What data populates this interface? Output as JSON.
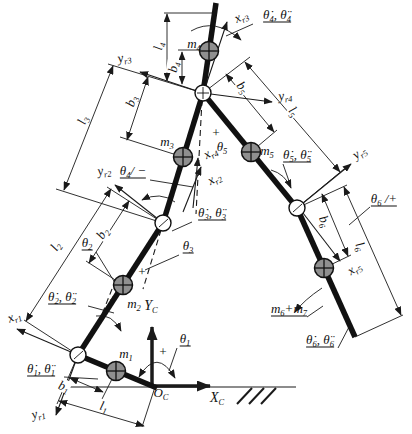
{
  "colors": {
    "line": "#1a1a1a",
    "mass_fill": "#8f8f8f",
    "background": "#ffffff"
  },
  "labels": [
    {
      "name": "x-r3",
      "x": 241,
      "y": 16,
      "rot": -25,
      "parts": [
        {
          "t": "x"
        },
        {
          "s": "r3"
        }
      ]
    },
    {
      "name": "theta4-rates",
      "x": 277,
      "y": 15,
      "underline": true,
      "parts": [
        {
          "t": "θ̇"
        },
        {
          "s": "4"
        },
        {
          "t": ", θ̈"
        },
        {
          "s": "4"
        }
      ]
    },
    {
      "name": "m4",
      "x": 194,
      "y": 43,
      "parts": [
        {
          "t": "m"
        },
        {
          "s": "4"
        }
      ]
    },
    {
      "name": "l4",
      "x": 158,
      "y": 46,
      "rot": -80,
      "bg": true,
      "parts": [
        {
          "t": "l"
        },
        {
          "s": "4"
        }
      ]
    },
    {
      "name": "b4",
      "x": 173,
      "y": 67,
      "rot": -80,
      "bg": true,
      "parts": [
        {
          "t": "b"
        },
        {
          "s": "4"
        }
      ]
    },
    {
      "name": "y-r3",
      "x": 124,
      "y": 57,
      "rot": -12,
      "parts": [
        {
          "t": "y"
        },
        {
          "s": "r3"
        }
      ]
    },
    {
      "name": "b3",
      "x": 131,
      "y": 101,
      "rot": -72,
      "bg": true,
      "parts": [
        {
          "t": "b"
        },
        {
          "s": "3"
        }
      ]
    },
    {
      "name": "l3",
      "x": 82,
      "y": 120,
      "rot": -70,
      "bg": true,
      "parts": [
        {
          "t": "l"
        },
        {
          "s": "3"
        }
      ]
    },
    {
      "name": "y-r4",
      "x": 285,
      "y": 95,
      "rot": -8,
      "parts": [
        {
          "t": "y"
        },
        {
          "s": "r4"
        }
      ]
    },
    {
      "name": "b5",
      "x": 243,
      "y": 87,
      "rot": 51,
      "bg": true,
      "parts": [
        {
          "t": "b"
        },
        {
          "s": "5"
        }
      ]
    },
    {
      "name": "l5",
      "x": 294,
      "y": 111,
      "rot": 50,
      "bg": true,
      "parts": [
        {
          "t": "l"
        },
        {
          "s": "5"
        }
      ]
    },
    {
      "name": "plus-theta5",
      "x": 216,
      "y": 132,
      "parts": [
        {
          "t": "+"
        }
      ]
    },
    {
      "name": "theta5",
      "x": 222,
      "y": 146,
      "parts": [
        {
          "t": "θ"
        },
        {
          "s": "5"
        }
      ]
    },
    {
      "name": "m5",
      "x": 267,
      "y": 150,
      "parts": [
        {
          "t": "m"
        },
        {
          "s": "5"
        }
      ]
    },
    {
      "name": "theta5-rates",
      "x": 297,
      "y": 155,
      "underline": true,
      "parts": [
        {
          "t": "θ̇"
        },
        {
          "s": "5"
        },
        {
          "t": ", θ̈"
        },
        {
          "s": "5"
        }
      ]
    },
    {
      "name": "y-r5",
      "x": 359,
      "y": 152,
      "rot": -35,
      "parts": [
        {
          "t": "y"
        },
        {
          "s": "r5"
        }
      ]
    },
    {
      "name": "theta4-sign",
      "x": 133,
      "y": 171,
      "underline": true,
      "parts": [
        {
          "t": "θ"
        },
        {
          "s": "4"
        },
        {
          "t": "/ −"
        }
      ]
    },
    {
      "name": "y-r2",
      "x": 104,
      "y": 170,
      "rot": -10,
      "parts": [
        {
          "t": "y"
        },
        {
          "s": "r2"
        }
      ]
    },
    {
      "name": "x-r4",
      "x": 210,
      "y": 152,
      "rot": -30,
      "parts": [
        {
          "t": "x"
        },
        {
          "s": "r4"
        }
      ]
    },
    {
      "name": "x-r2",
      "x": 214,
      "y": 178,
      "rot": -30,
      "parts": [
        {
          "t": "x"
        },
        {
          "s": "r2"
        }
      ]
    },
    {
      "name": "theta3-rates",
      "x": 212,
      "y": 213,
      "underline": true,
      "parts": [
        {
          "t": "θ̇"
        },
        {
          "s": "3"
        },
        {
          "t": ", θ̈"
        },
        {
          "s": "3"
        }
      ]
    },
    {
      "name": "theta3",
      "x": 188,
      "y": 246,
      "underline": true,
      "parts": [
        {
          "t": "θ"
        },
        {
          "s": "3"
        }
      ]
    },
    {
      "name": "theta6-sign",
      "x": 384,
      "y": 199,
      "underline": true,
      "parts": [
        {
          "t": "θ"
        },
        {
          "s": "6"
        },
        {
          "t": " /+"
        }
      ]
    },
    {
      "name": "b6",
      "x": 325,
      "y": 221,
      "rot": 66,
      "bg": true,
      "parts": [
        {
          "t": "b"
        },
        {
          "s": "6"
        }
      ]
    },
    {
      "name": "l6",
      "x": 361,
      "y": 246,
      "rot": 66,
      "bg": true,
      "parts": [
        {
          "t": "l"
        },
        {
          "s": "6"
        }
      ]
    },
    {
      "name": "x-r5",
      "x": 354,
      "y": 268,
      "rot": -35,
      "parts": [
        {
          "t": "x"
        },
        {
          "s": "r5"
        }
      ]
    },
    {
      "name": "l2",
      "x": 55,
      "y": 246,
      "rot": -57,
      "bg": true,
      "parts": [
        {
          "t": "l"
        },
        {
          "s": "2"
        }
      ]
    },
    {
      "name": "b2",
      "x": 102,
      "y": 233,
      "rot": -57,
      "bg": true,
      "parts": [
        {
          "t": "b"
        },
        {
          "s": "2"
        }
      ]
    },
    {
      "name": "theta2",
      "x": 87,
      "y": 243,
      "underline": true,
      "parts": [
        {
          "t": "θ"
        },
        {
          "s": "2"
        }
      ]
    },
    {
      "name": "theta2-rates",
      "x": 62,
      "y": 297,
      "underline": true,
      "parts": [
        {
          "t": "θ̇"
        },
        {
          "s": "2"
        },
        {
          "t": ", θ̈"
        },
        {
          "s": "2"
        }
      ]
    },
    {
      "name": "m2",
      "x": 134,
      "y": 303,
      "parts": [
        {
          "t": "m"
        },
        {
          "s": "2"
        }
      ]
    },
    {
      "name": "m3",
      "x": 167,
      "y": 141,
      "parts": [
        {
          "t": "m"
        },
        {
          "s": "3"
        }
      ]
    },
    {
      "name": "m6-plus-m7",
      "x": 289,
      "y": 309,
      "underline": true,
      "parts": [
        {
          "t": "m"
        },
        {
          "s": "6"
        },
        {
          "t": "+"
        },
        {
          "t": "m"
        },
        {
          "s": "7"
        }
      ]
    },
    {
      "name": "theta6-rates",
      "x": 320,
      "y": 340,
      "underline": true,
      "parts": [
        {
          "t": "θ̇"
        },
        {
          "s": "6"
        },
        {
          "t": ", θ̈"
        },
        {
          "s": "6"
        }
      ]
    },
    {
      "name": "theta1-rates",
      "x": 41,
      "y": 369,
      "underline": true,
      "parts": [
        {
          "t": "θ̇"
        },
        {
          "s": "1"
        },
        {
          "t": ", θ̈"
        },
        {
          "s": "1"
        }
      ]
    },
    {
      "name": "x-r1",
      "x": 14,
      "y": 316,
      "rot": -22,
      "parts": [
        {
          "t": "x"
        },
        {
          "s": "r1"
        }
      ]
    },
    {
      "name": "y-r1",
      "x": 38,
      "y": 413,
      "rot": -15,
      "parts": [
        {
          "t": "y"
        },
        {
          "s": "r1"
        }
      ]
    },
    {
      "name": "m1",
      "x": 126,
      "y": 353,
      "parts": [
        {
          "t": "m"
        },
        {
          "s": "1"
        }
      ]
    },
    {
      "name": "theta1",
      "x": 185,
      "y": 339,
      "underline": true,
      "parts": [
        {
          "t": "θ"
        },
        {
          "s": "1"
        }
      ]
    },
    {
      "name": "plus-theta1",
      "x": 163,
      "y": 351,
      "parts": [
        {
          "t": "+"
        }
      ]
    },
    {
      "name": "plus-theta3",
      "x": 142,
      "y": 271,
      "parts": [
        {
          "t": "+"
        }
      ]
    },
    {
      "name": "plus-theta2",
      "x": 113,
      "y": 299,
      "parts": [
        {
          "t": "+"
        }
      ]
    },
    {
      "name": "Y-C",
      "x": 151,
      "y": 306,
      "size": 14,
      "parts": [
        {
          "t": "Y"
        },
        {
          "s": "C"
        }
      ]
    },
    {
      "name": "X-C",
      "x": 217,
      "y": 398,
      "size": 14,
      "parts": [
        {
          "t": "X"
        },
        {
          "s": "C"
        }
      ]
    },
    {
      "name": "O-C",
      "x": 161,
      "y": 392,
      "parts": [
        {
          "t": "O"
        },
        {
          "s": "C"
        }
      ]
    },
    {
      "name": "b1",
      "x": 64,
      "y": 386,
      "rot": 20,
      "bg": true,
      "parts": [
        {
          "t": "b"
        },
        {
          "s": "1"
        }
      ]
    },
    {
      "name": "l1",
      "x": 104,
      "y": 406,
      "rot": 15,
      "bg": true,
      "parts": [
        {
          "t": "l"
        },
        {
          "s": "1"
        }
      ]
    }
  ]
}
